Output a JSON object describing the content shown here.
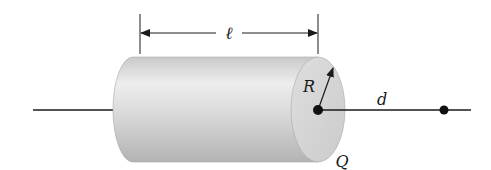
{
  "diagram": {
    "labels": {
      "length": "ℓ",
      "radius": "R",
      "distance": "d",
      "charge": "Q"
    },
    "colors": {
      "line": "#1a1a1a",
      "cylinder_light": "#ececec",
      "cylinder_mid": "#d2d2d2",
      "cylinder_dark": "#b4b4b4",
      "end_cap": "#d6d6d6"
    }
  }
}
